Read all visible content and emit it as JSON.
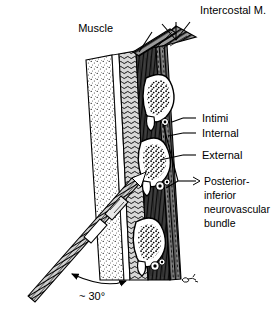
{
  "figure": {
    "background_color": "#ffffff",
    "ink_color": "#000000",
    "width": 279,
    "height": 309
  },
  "labels": {
    "intercostal_muscle": "Intercostal M.",
    "muscle": "Muscle",
    "intimi": "Intimi",
    "internal": "Internal",
    "external": "External",
    "bundle_line1": "Posterior-",
    "bundle_line2": "inferior",
    "bundle_line3": "neurovascular",
    "bundle_line4": "bundle",
    "angle": "~ 30°"
  },
  "annotations": {
    "needle_angle_degrees": 30,
    "needle_angle_qualifier": "approximately",
    "rib_count": 3,
    "muscle_layer_names": [
      "Intimi",
      "Internal",
      "External"
    ],
    "signature_present": true
  },
  "structures": {
    "skin_fascia_layer": "stippled outer layer",
    "muscle_layer": "dark hatched band",
    "rib_sections": "white cortical ovals with stippled marrow",
    "neurovascular_bundles": "small round vessels inferior to each rib",
    "needle": "oblique needle entering from lower left"
  }
}
